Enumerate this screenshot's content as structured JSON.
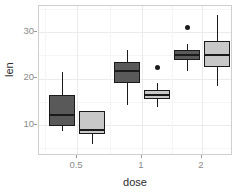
{
  "chart_data": {
    "type": "box",
    "title": "",
    "xlabel": "dose",
    "ylabel": "len",
    "x_categories": [
      "0.5",
      "1",
      "2"
    ],
    "x_tick_labels": [
      "0.5",
      "1",
      "2"
    ],
    "y_tick_labels": [
      "10",
      "20",
      "30"
    ],
    "y_ticks": [
      10,
      20,
      30
    ],
    "ylim": [
      4.2,
      36.5
    ],
    "grid": "major and minor horizontal + vertical, light gray",
    "legend": "none",
    "group_fill_colors": [
      "#595959",
      "#c8c8c8"
    ],
    "outline_color": "#1a1a1a",
    "boxes": [
      {
        "dose": "0.5",
        "group": "dark",
        "fill": "#595959",
        "whisker_low": 8.7,
        "q1": 9.8,
        "median": 12.2,
        "q3": 16.4,
        "whisker_high": 21.4,
        "outliers": []
      },
      {
        "dose": "0.5",
        "group": "light",
        "fill": "#c8c8c8",
        "whisker_low": 5.9,
        "q1": 8.0,
        "median": 9.0,
        "q3": 13.0,
        "whisker_high": 11.3,
        "outliers": []
      },
      {
        "dose": "1",
        "group": "dark",
        "fill": "#595959",
        "whisker_low": 14.3,
        "q1": 19.0,
        "median": 21.6,
        "q3": 23.5,
        "whisker_high": 26.1,
        "outliers": []
      },
      {
        "dose": "1",
        "group": "light",
        "fill": "#c8c8c8",
        "whisker_low": 13.8,
        "q1": 15.6,
        "median": 16.5,
        "q3": 17.5,
        "whisker_high": 19.0,
        "outliers": [
          22.3
        ]
      },
      {
        "dose": "2",
        "group": "dark",
        "fill": "#595959",
        "whisker_low": 21.6,
        "q1": 24.0,
        "median": 25.1,
        "q3": 26.2,
        "whisker_high": 27.4,
        "outliers": [
          30.9
        ]
      },
      {
        "dose": "2",
        "group": "light",
        "fill": "#c8c8c8",
        "whisker_low": 18.4,
        "q1": 22.5,
        "median": 25.1,
        "q3": 28.0,
        "whisker_high": 33.6,
        "outliers": []
      }
    ]
  },
  "axes": {
    "y_title": "len",
    "x_title": "dose",
    "y_tick_1": "10",
    "y_tick_2": "20",
    "y_tick_3": "30",
    "x_tick_1": "0.5",
    "x_tick_2": "1",
    "x_tick_3": "2"
  }
}
